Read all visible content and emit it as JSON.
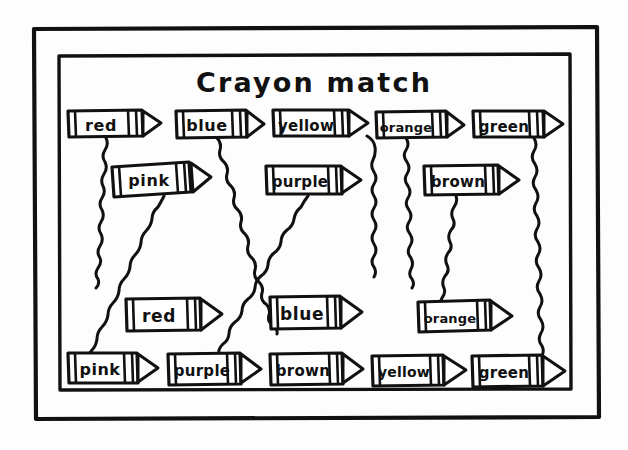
{
  "page": {
    "title": "Crayon match",
    "background_color": "#fdfdfd",
    "ink_color": "#111111",
    "style": "hand-drawn black ink on white paper",
    "width": 628,
    "height": 450
  },
  "frame": {
    "outer_border_name": "outer-frame",
    "inner_border_name": "inner-frame"
  },
  "rows": [
    {
      "row_name": "top-row",
      "y": 110,
      "crayons": [
        {
          "label": "red",
          "x": 68,
          "width": 92,
          "tip": "right"
        },
        {
          "label": "blue",
          "x": 176,
          "width": 88,
          "tip": "right"
        },
        {
          "label": "yellow",
          "x": 273,
          "width": 95,
          "tip": "right"
        },
        {
          "label": "orange",
          "x": 376,
          "width": 88,
          "tip": "right"
        },
        {
          "label": "green",
          "x": 473,
          "width": 90,
          "tip": "right"
        }
      ]
    },
    {
      "row_name": "second-row",
      "y": 160,
      "crayons": [
        {
          "label": "pink",
          "x": 112,
          "width": 96,
          "tip": "right"
        },
        {
          "label": "purple",
          "x": 266,
          "width": 95,
          "tip": "right"
        },
        {
          "label": "brown",
          "x": 424,
          "width": 96,
          "tip": "right"
        }
      ]
    },
    {
      "row_name": "third-row",
      "y": 298,
      "crayons": [
        {
          "label": "red",
          "x": 126,
          "width": 96,
          "tip": "right"
        },
        {
          "label": "blue",
          "x": 270,
          "width": 92,
          "tip": "right"
        },
        {
          "label": "orange",
          "x": 418,
          "width": 94,
          "tip": "right"
        }
      ]
    },
    {
      "row_name": "bottom-row",
      "y": 352,
      "crayons": [
        {
          "label": "pink",
          "x": 68,
          "width": 90,
          "tip": "right"
        },
        {
          "label": "purple",
          "x": 168,
          "width": 95,
          "tip": "right"
        },
        {
          "label": "brown",
          "x": 270,
          "width": 95,
          "tip": "right"
        },
        {
          "label": "yellow",
          "x": 372,
          "width": 95,
          "tip": "right"
        },
        {
          "label": "green",
          "x": 472,
          "width": 92,
          "tip": "right"
        }
      ]
    }
  ],
  "connections": [
    {
      "name": "line-red-top",
      "from": "red (top row)",
      "to": "unfinished",
      "complete": false
    },
    {
      "name": "line-blue-top",
      "from": "blue (top row)",
      "to": "blue (third row)",
      "complete": true
    },
    {
      "name": "line-yellow-top",
      "from": "yellow (top row)",
      "to": "unfinished",
      "complete": false
    },
    {
      "name": "line-orange-top",
      "from": "orange (top row)",
      "to": "unfinished",
      "complete": false
    },
    {
      "name": "line-green-top",
      "from": "green (top row)",
      "to": "green (bottom row)",
      "complete": true
    },
    {
      "name": "line-pink-mid",
      "from": "pink (second row)",
      "to": "pink (bottom row)",
      "complete": true
    },
    {
      "name": "line-purple-mid",
      "from": "purple (second row)",
      "to": "purple (bottom row)",
      "complete": true
    },
    {
      "name": "line-brown-mid",
      "from": "brown (second row)",
      "to": "unfinished",
      "complete": false
    }
  ],
  "labels": {
    "red": "red",
    "blue": "blue",
    "yellow": "yellow",
    "orange": "orange",
    "green": "green",
    "pink": "pink",
    "purple": "purple",
    "brown": "brown"
  }
}
